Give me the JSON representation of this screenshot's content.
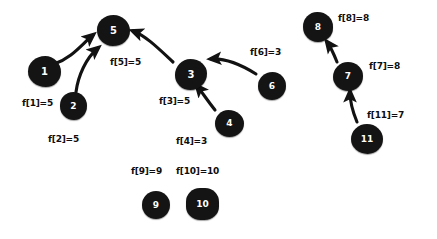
{
  "diagram": {
    "background_color": "#ffffff",
    "node_color": "#141414",
    "node_text_color": "#ffffff",
    "label_color": "#0d0d0d",
    "edge_color": "#121212"
  },
  "nodes": [
    {
      "id": "1",
      "text": "1",
      "x": 28,
      "y": 56,
      "w": 33,
      "h": 31,
      "radius": "52% 48% 46% 54% / 50% 52% 48% 50%",
      "font_size": 10
    },
    {
      "id": "2",
      "text": "2",
      "x": 60,
      "y": 92,
      "w": 27,
      "h": 28,
      "radius": "50% 50% 48% 52% / 48% 50% 52% 50%",
      "font_size": 9
    },
    {
      "id": "3",
      "text": "3",
      "x": 175,
      "y": 59,
      "w": 32,
      "h": 31,
      "radius": "48% 52% 52% 48% / 52% 46% 54% 48%",
      "font_size": 10
    },
    {
      "id": "4",
      "text": "4",
      "x": 215,
      "y": 110,
      "w": 29,
      "h": 27,
      "radius": "46% 54% 50% 50% / 50% 50% 50% 50%",
      "font_size": 9
    },
    {
      "id": "5",
      "text": "5",
      "x": 97,
      "y": 15,
      "w": 33,
      "h": 31,
      "radius": "50% 50% 52% 48% / 48% 52% 48% 52%",
      "font_size": 10
    },
    {
      "id": "6",
      "text": "6",
      "x": 258,
      "y": 72,
      "w": 28,
      "h": 28,
      "radius": "52% 48% 50% 50% / 50% 50% 50% 50%",
      "font_size": 9
    },
    {
      "id": "7",
      "text": "7",
      "x": 333,
      "y": 62,
      "w": 30,
      "h": 29,
      "radius": "50% 50% 48% 52% / 52% 48% 52% 48%",
      "font_size": 9
    },
    {
      "id": "8",
      "text": "8",
      "x": 303,
      "y": 12,
      "w": 30,
      "h": 30,
      "radius": "48% 52% 50% 50% / 50% 50% 48% 52%",
      "font_size": 9
    },
    {
      "id": "9",
      "text": "9",
      "x": 142,
      "y": 191,
      "w": 28,
      "h": 28,
      "radius": "50% 50% 50% 50% / 50% 50% 50% 50%",
      "font_size": 9
    },
    {
      "id": "10",
      "text": "10",
      "x": 186,
      "y": 188,
      "w": 33,
      "h": 32,
      "radius": "42% 42% 44% 44% / 44% 44% 42% 42%",
      "font_size": 9
    },
    {
      "id": "11",
      "text": "11",
      "x": 351,
      "y": 124,
      "w": 32,
      "h": 30,
      "radius": "50% 50% 48% 52% / 50% 50% 50% 50%",
      "font_size": 9
    }
  ],
  "labels": [
    {
      "id": "f1",
      "text": "f[1]=5",
      "x": 22,
      "y": 98,
      "font_size": 9
    },
    {
      "id": "f2",
      "text": "f[2]=5",
      "x": 48,
      "y": 134,
      "font_size": 9
    },
    {
      "id": "f3",
      "text": "f[3]=5",
      "x": 159,
      "y": 96,
      "font_size": 9
    },
    {
      "id": "f4",
      "text": "f[4]=3",
      "x": 176,
      "y": 136,
      "font_size": 9
    },
    {
      "id": "f5",
      "text": "f[5]=5",
      "x": 110,
      "y": 57,
      "font_size": 9
    },
    {
      "id": "f6",
      "text": "f[6]=3",
      "x": 250,
      "y": 47,
      "font_size": 9
    },
    {
      "id": "f7",
      "text": "f[7]=8",
      "x": 369,
      "y": 61,
      "font_size": 9
    },
    {
      "id": "f8",
      "text": "f[8]=8",
      "x": 338,
      "y": 13,
      "font_size": 9
    },
    {
      "id": "f9",
      "text": "f[9]=9",
      "x": 131,
      "y": 166,
      "font_size": 9
    },
    {
      "id": "f10",
      "text": "f[10]=10",
      "x": 176,
      "y": 166,
      "font_size": 9
    },
    {
      "id": "f11",
      "text": "f[11]=7",
      "x": 367,
      "y": 110,
      "font_size": 9
    }
  ],
  "edges": [
    {
      "id": "e1",
      "from": "1",
      "to": "5",
      "path": "M 54 64 C 72 58, 82 44, 93 35"
    },
    {
      "id": "e2",
      "from": "2",
      "to": "5",
      "path": "M 76 92 C 78 76, 86 58, 98 48"
    },
    {
      "id": "e3",
      "from": "3",
      "to": "5",
      "path": "M 173 62 C 158 48, 146 36, 133 31"
    },
    {
      "id": "e4",
      "from": "6",
      "to": "3",
      "path": "M 256 74 C 240 64, 226 58, 211 59"
    },
    {
      "id": "e5",
      "from": "4",
      "to": "3",
      "path": "M 215 110 C 207 100, 202 92, 197 86"
    },
    {
      "id": "e6",
      "from": "11",
      "to": "7",
      "path": "M 357 122 C 352 110, 350 100, 350 92"
    },
    {
      "id": "e7",
      "from": "7",
      "to": "8",
      "path": "M 337 62 C 333 52, 330 46, 327 42"
    }
  ]
}
